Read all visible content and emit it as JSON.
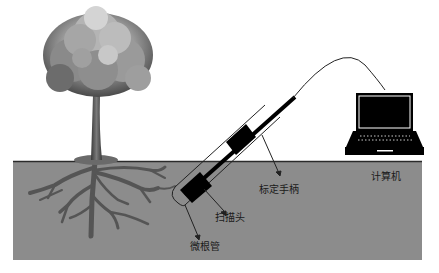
{
  "diagram": {
    "type": "minirhizotron-setup",
    "colors": {
      "soil": "#8c8c8c",
      "soil_line": "#2a2a2a",
      "roots": "#555555",
      "probe": "#000000",
      "laptop": "#000000",
      "cable": "#222222"
    },
    "labels": {
      "calibration_handle": "标定手柄",
      "scan_head": "扫描头",
      "minirhizotron_tube": "微根管",
      "computer": "计算机"
    },
    "components": [
      {
        "id": "tree",
        "icon": "tree-icon"
      },
      {
        "id": "soil",
        "icon": "soil-block"
      },
      {
        "id": "roots",
        "icon": "root-system-icon"
      },
      {
        "id": "tube",
        "icon": "tube-icon"
      },
      {
        "id": "probe",
        "icon": "probe-icon"
      },
      {
        "id": "cable",
        "icon": "cable-icon"
      },
      {
        "id": "laptop",
        "icon": "laptop-icon"
      }
    ]
  }
}
